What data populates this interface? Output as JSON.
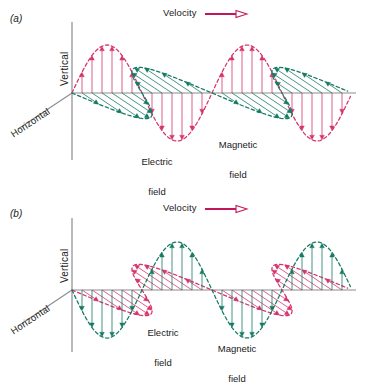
{
  "figure": {
    "background_color": "#ffffff",
    "colors": {
      "red": "#d6336c",
      "green": "#157a63",
      "axis_gray": "#808080",
      "text": "#1a1a1a"
    }
  },
  "panels": [
    {
      "tag": "(a)",
      "velocity_label": "Velocity",
      "velocity_arrow": "arrow-right-open",
      "axis_vertical_label": "Vertical",
      "axis_horizontal_label": "Horizontal",
      "electric_label_line1": "Electric",
      "electric_label_line2": "field",
      "magnetic_label_line1": "Magnetic",
      "magnetic_label_line2": "field",
      "electric_color": "#d6336c",
      "magnetic_color": "#157a63",
      "electric_plane": "vertical",
      "magnetic_plane": "horizontal",
      "electric_phase_start": "positive",
      "magnetic_phase_start": "negative"
    },
    {
      "tag": "(b)",
      "velocity_label": "Velocity",
      "velocity_arrow": "arrow-right-open",
      "axis_vertical_label": "Vertical",
      "axis_horizontal_label": "Horizontal",
      "electric_label_line1": "Electric",
      "electric_label_line2": "field",
      "magnetic_label_line1": "Magnetic",
      "magnetic_label_line2": "field",
      "electric_color": "#d6336c",
      "magnetic_color": "#157a63",
      "electric_plane": "horizontal",
      "magnetic_plane": "vertical",
      "electric_phase_start": "negative",
      "magnetic_phase_start": "negative"
    }
  ],
  "chart_data": {
    "type": "line",
    "xlabel": "Propagation direction (Velocity)",
    "ylabel": "Vertical",
    "x_start_px": 72,
    "x_end_px": 352,
    "wavelength_px": 140,
    "amplitude_px": 48,
    "n_arrows_per_half_cycle": 6,
    "series": [
      {
        "name": "Electric field (a)",
        "panel": "(a)",
        "color": "#d6336c",
        "plane": "vertical",
        "phase_deg": 0,
        "samples": [
          0,
          0.43,
          0.78,
          0.97,
          0.97,
          0.78,
          0.43,
          0,
          -0.43,
          -0.78,
          -0.97,
          -0.97,
          -0.78,
          -0.43,
          0,
          0.43,
          0.78,
          0.97,
          0.97,
          0.78,
          0.43,
          0,
          -0.43,
          -0.78,
          -0.97,
          -0.97,
          -0.78,
          -0.43,
          0
        ]
      },
      {
        "name": "Magnetic field (a)",
        "panel": "(a)",
        "color": "#157a63",
        "plane": "horizontal",
        "phase_deg": 180,
        "samples": [
          0,
          -0.43,
          -0.78,
          -0.97,
          -0.97,
          -0.78,
          -0.43,
          0,
          0.43,
          0.78,
          0.97,
          0.97,
          0.78,
          0.43,
          0,
          -0.43,
          -0.78,
          -0.97,
          -0.97,
          -0.78,
          -0.43,
          0,
          0.43,
          0.78,
          0.97,
          0.97,
          0.78,
          0.43,
          0
        ]
      },
      {
        "name": "Electric field (b)",
        "panel": "(b)",
        "color": "#d6336c",
        "plane": "horizontal",
        "phase_deg": 180,
        "samples": [
          0,
          -0.43,
          -0.78,
          -0.97,
          -0.97,
          -0.78,
          -0.43,
          0,
          0.43,
          0.78,
          0.97,
          0.97,
          0.78,
          0.43,
          0,
          -0.43,
          -0.78,
          -0.97,
          -0.97,
          -0.78,
          -0.43,
          0,
          0.43,
          0.78,
          0.97,
          0.97,
          0.78,
          0.43,
          0
        ]
      },
      {
        "name": "Magnetic field (b)",
        "panel": "(b)",
        "color": "#157a63",
        "plane": "vertical",
        "phase_deg": 180,
        "samples": [
          0,
          -0.43,
          -0.78,
          -0.97,
          -0.97,
          -0.78,
          -0.43,
          0,
          0.43,
          0.78,
          0.97,
          0.97,
          0.78,
          0.43,
          0,
          -0.43,
          -0.78,
          -0.97,
          -0.97,
          -0.78,
          -0.43,
          0,
          0.43,
          0.78,
          0.97,
          0.97,
          0.78,
          0.43,
          0
        ]
      }
    ],
    "legend": [
      "Electric field",
      "Magnetic field"
    ],
    "grid": false,
    "annotations": [
      "Velocity",
      "Vertical",
      "Horizontal",
      "Electric field",
      "Magnetic field"
    ]
  }
}
